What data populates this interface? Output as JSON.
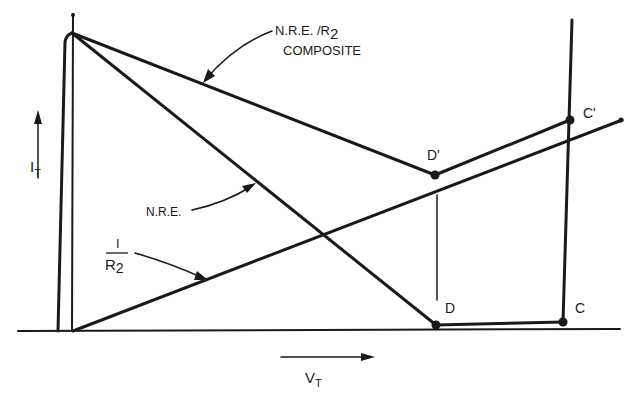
{
  "diagram": {
    "type": "I-V characteristic diagram",
    "axes": {
      "y_label": "I",
      "y_label_sub": "T",
      "x_label": "V",
      "x_label_sub": "T"
    },
    "curves": {
      "composite": {
        "label_line1": "N.R.E. /R",
        "label_line1_sub": "2",
        "label_line2": "COMPOSITE"
      },
      "nre": {
        "label": "N.R.E."
      },
      "r2": {
        "label_num": "I",
        "label_den": "R",
        "label_den_sub": "2"
      }
    },
    "points": {
      "d_prime": "D'",
      "c_prime": "C'",
      "d": "D",
      "c": "C"
    },
    "colors": {
      "ink": "#1a1a1a",
      "background": "#ffffff"
    }
  }
}
